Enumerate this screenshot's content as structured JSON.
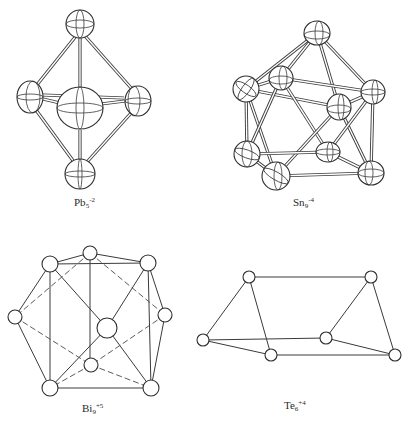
{
  "figure": {
    "panels": [
      {
        "id": "pb5",
        "label": {
          "element": "Pb",
          "count": "5",
          "charge": "-2"
        },
        "atoms": [
          {
            "name": "top",
            "x": 80,
            "y": 24,
            "r": 14
          },
          {
            "name": "left",
            "x": 30,
            "y": 97,
            "r": 14
          },
          {
            "name": "center",
            "x": 80,
            "y": 108,
            "r": 22
          },
          {
            "name": "right",
            "x": 138,
            "y": 101,
            "r": 14
          },
          {
            "name": "bottom",
            "x": 80,
            "y": 174,
            "r": 15
          }
        ]
      },
      {
        "id": "sn9",
        "label": {
          "element": "Sn",
          "count": "9",
          "charge": "-4"
        },
        "atoms": [
          {
            "name": "top",
            "x": 317,
            "y": 33,
            "r": 13
          },
          {
            "name": "upper-left",
            "x": 246,
            "y": 89,
            "r": 13
          },
          {
            "name": "upper-inner",
            "x": 281,
            "y": 78,
            "r": 12
          },
          {
            "name": "upper-right",
            "x": 373,
            "y": 92,
            "r": 12
          },
          {
            "name": "mid-right",
            "x": 339,
            "y": 107,
            "r": 12
          },
          {
            "name": "lower-left",
            "x": 247,
            "y": 154,
            "r": 13
          },
          {
            "name": "lower-front-left",
            "x": 276,
            "y": 176,
            "r": 14
          },
          {
            "name": "lower-inner",
            "x": 328,
            "y": 152,
            "r": 11
          },
          {
            "name": "lower-right",
            "x": 371,
            "y": 173,
            "r": 13
          }
        ]
      },
      {
        "id": "bi9",
        "label": {
          "element": "Bi",
          "count": "9",
          "charge": "+5"
        },
        "atoms": [
          {
            "name": "top",
            "x": 90,
            "y": 253,
            "r": 7
          },
          {
            "name": "top-left",
            "x": 50,
            "y": 264,
            "r": 8
          },
          {
            "name": "top-right",
            "x": 148,
            "y": 263,
            "r": 8
          },
          {
            "name": "left",
            "x": 15,
            "y": 317,
            "r": 7
          },
          {
            "name": "right",
            "x": 165,
            "y": 315,
            "r": 7
          },
          {
            "name": "center",
            "x": 107,
            "y": 328,
            "r": 10
          },
          {
            "name": "lower-center",
            "x": 91,
            "y": 365,
            "r": 7
          },
          {
            "name": "bottom-left",
            "x": 50,
            "y": 388,
            "r": 8
          },
          {
            "name": "bottom-right",
            "x": 151,
            "y": 388,
            "r": 8
          }
        ]
      },
      {
        "id": "te6",
        "label": {
          "element": "Te",
          "count": "6",
          "charge": "+4"
        },
        "atoms": [
          {
            "name": "top-left",
            "x": 249,
            "y": 277,
            "r": 6
          },
          {
            "name": "top-right",
            "x": 371,
            "y": 277,
            "r": 6
          },
          {
            "name": "left",
            "x": 203,
            "y": 340,
            "r": 6
          },
          {
            "name": "left-mid",
            "x": 271,
            "y": 355,
            "r": 6
          },
          {
            "name": "right-mid",
            "x": 326,
            "y": 338,
            "r": 6
          },
          {
            "name": "right",
            "x": 395,
            "y": 355,
            "r": 6
          }
        ]
      }
    ]
  },
  "labels": {
    "pb5": {
      "element": "Pb",
      "count": "5",
      "charge": "-2"
    },
    "sn9": {
      "element": "Sn",
      "count": "9",
      "charge": "-4"
    },
    "bi9": {
      "element": "Bi",
      "count": "9",
      "charge": "+5"
    },
    "te6": {
      "element": "Te",
      "count": "6",
      "charge": "+4"
    }
  }
}
